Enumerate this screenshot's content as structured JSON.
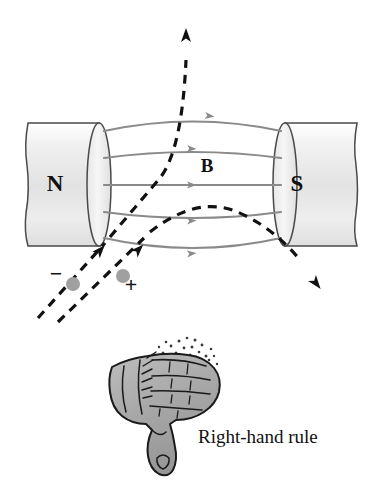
{
  "figure": {
    "name": "magnetic-force-right-hand-rule-diagram",
    "background_color": "#ffffff",
    "width": 386,
    "height": 486
  },
  "magnets": {
    "north": {
      "label": "N",
      "label_x": 55,
      "label_y": 191,
      "body_fill_light": "#f2f2f2",
      "body_fill_mid": "#dcdcdc",
      "outline_color": "#4a4a4a"
    },
    "south": {
      "label": "S",
      "label_x": 297,
      "label_y": 191,
      "body_fill_light": "#f4f4f4",
      "body_fill_mid": "#dddddd",
      "outline_color": "#4a4a4a"
    }
  },
  "field": {
    "label": "B",
    "label_x": 207,
    "label_y": 172,
    "line_color": "#8a8a8a",
    "line_width": 2.2,
    "arrow_color": "#8a8a8a",
    "line_count": 5
  },
  "charges": [
    {
      "sign": "−",
      "name": "negative-charge",
      "sign_x": 56,
      "sign_y": 281,
      "circle_x": 73,
      "circle_y": 284,
      "radius": 7,
      "fill": "#a0a0a0"
    },
    {
      "sign": "+",
      "name": "positive-charge",
      "sign_x": 131,
      "sign_y": 290,
      "circle_x": 123,
      "circle_y": 276,
      "radius": 7,
      "fill": "#a0a0a0"
    }
  ],
  "trajectories": {
    "color": "#111111",
    "dash_pattern": "9 7",
    "width": 3.2,
    "negative_label": "negative charge deflection path",
    "positive_label": "positive charge deflection path"
  },
  "hand": {
    "name": "right-hand-illustration",
    "fill": "#a8a8a8",
    "outline": "#1a1a1a",
    "stipple_color": "#3a3a3a"
  },
  "caption": {
    "text": "Right-hand rule",
    "x": 198,
    "y": 443,
    "font_size": 19
  }
}
